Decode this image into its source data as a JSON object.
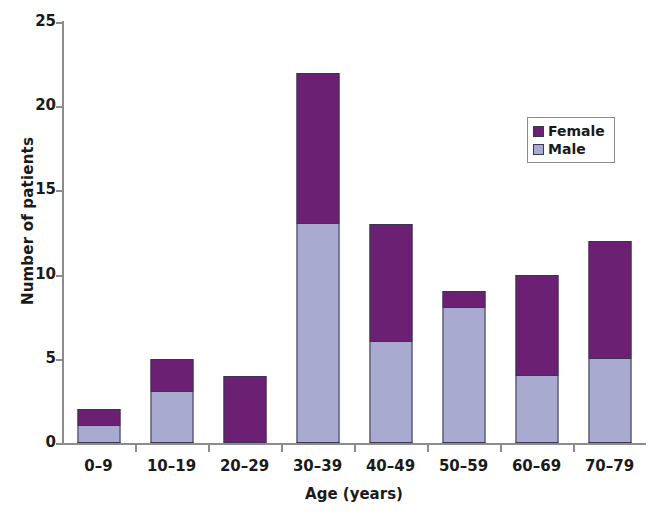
{
  "chart_data": {
    "type": "bar",
    "subtype": "stacked-vertical",
    "title": "",
    "xlabel": "Age (years)",
    "ylabel": "Number of patients",
    "categories": [
      "0–9",
      "10–19",
      "20–29",
      "30–39",
      "40–49",
      "50–59",
      "60–69",
      "70–79"
    ],
    "series": [
      {
        "name": "Female",
        "color": "#6b2073",
        "values": [
          1,
          2,
          4,
          9,
          7,
          1,
          6,
          7
        ]
      },
      {
        "name": "Male",
        "color": "#a8aacf",
        "values": [
          1,
          3,
          0,
          13,
          6,
          8,
          4,
          5
        ]
      }
    ],
    "stack_order_bottom_to_top": [
      "Male",
      "Female"
    ],
    "totals": [
      2,
      5,
      4,
      22,
      13,
      9,
      10,
      12
    ],
    "ylim": [
      0,
      25
    ],
    "yticks": [
      0,
      5,
      10,
      15,
      20,
      25
    ],
    "ytick_labels": [
      "0",
      "5",
      "10",
      "15",
      "20",
      "25"
    ],
    "grid": false,
    "legend_position": "upper right",
    "legend_entries": [
      "Female",
      "Male"
    ]
  },
  "axis": {
    "y_title": "Number of patients",
    "x_title": "Age (years)"
  }
}
